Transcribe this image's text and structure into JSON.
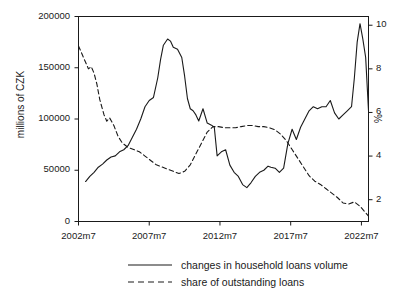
{
  "chart_data": {
    "type": "line",
    "title": "",
    "subtitle": "",
    "xlabel": "",
    "ylabel": "millions of CZK",
    "ylabel_right": "%",
    "grid": false,
    "legend_position": "bottom",
    "xlim": [
      2002.5,
      2023.0
    ],
    "ylim": [
      0,
      200000
    ],
    "ylim_right": [
      1.0,
      10.4
    ],
    "xticks": [
      "2002m7",
      "2007m7",
      "2012m7",
      "2017m7",
      "2022m7"
    ],
    "xtick_values": [
      2002.5,
      2007.5,
      2012.5,
      2017.5,
      2022.5
    ],
    "yticks_left": [
      "0",
      "50000",
      "100000",
      "150000",
      "200000"
    ],
    "ytick_values_left": [
      0,
      50000,
      100000,
      150000,
      200000
    ],
    "yticks_right": [
      "2",
      "4",
      "6",
      "8",
      "10"
    ],
    "ytick_values_right": [
      2,
      4,
      6,
      8,
      10
    ],
    "series": [
      {
        "name": "changes in household loans volume",
        "axis": "left",
        "style": "solid",
        "color": "#1a1a1a",
        "x": [
          2003.0,
          2003.3,
          2003.6,
          2003.9,
          2004.2,
          2004.5,
          2004.8,
          2005.1,
          2005.4,
          2005.7,
          2006.0,
          2006.3,
          2006.6,
          2006.9,
          2007.2,
          2007.5,
          2007.8,
          2008.1,
          2008.3,
          2008.5,
          2008.8,
          2009.0,
          2009.2,
          2009.5,
          2009.8,
          2010.0,
          2010.2,
          2010.4,
          2010.6,
          2010.8,
          2011.0,
          2011.3,
          2011.6,
          2011.9,
          2012.1,
          2012.3,
          2012.6,
          2012.9,
          2013.2,
          2013.5,
          2013.8,
          2014.1,
          2014.4,
          2014.7,
          2015.0,
          2015.3,
          2015.6,
          2015.9,
          2016.1,
          2016.4,
          2016.7,
          2017.0,
          2017.3,
          2017.6,
          2017.9,
          2018.2,
          2018.5,
          2018.8,
          2019.1,
          2019.4,
          2019.7,
          2020.0,
          2020.3,
          2020.6,
          2020.9,
          2021.2,
          2021.5,
          2021.8,
          2022.0,
          2022.2,
          2022.4,
          2022.6,
          2022.8,
          2023.0
        ],
        "y": [
          39000,
          44000,
          48000,
          53000,
          56000,
          60000,
          63000,
          64000,
          68000,
          70000,
          74000,
          82000,
          90000,
          100000,
          112000,
          118000,
          121000,
          140000,
          158000,
          172000,
          178000,
          176000,
          170000,
          168000,
          160000,
          142000,
          120000,
          110000,
          108000,
          104000,
          98000,
          110000,
          96000,
          94000,
          92000,
          64000,
          68000,
          70000,
          55000,
          48000,
          44000,
          36000,
          33000,
          38000,
          44000,
          48000,
          50000,
          54000,
          53000,
          52000,
          48000,
          52000,
          76000,
          90000,
          80000,
          92000,
          100000,
          108000,
          112000,
          110000,
          112000,
          112000,
          118000,
          106000,
          100000,
          104000,
          108000,
          112000,
          140000,
          175000,
          193000,
          178000,
          160000,
          108000
        ]
      },
      {
        "name": "share of outstanding loans",
        "axis": "right",
        "style": "dashed",
        "color": "#1a1a1a",
        "x": [
          2002.5,
          2002.8,
          2003.0,
          2003.2,
          2003.4,
          2003.6,
          2003.8,
          2004.0,
          2004.3,
          2004.5,
          2004.7,
          2005.0,
          2005.3,
          2005.6,
          2006.0,
          2006.4,
          2006.8,
          2007.2,
          2007.6,
          2008.0,
          2008.4,
          2008.8,
          2009.2,
          2009.6,
          2010.0,
          2010.4,
          2010.8,
          2011.2,
          2011.6,
          2012.0,
          2012.4,
          2012.8,
          2013.2,
          2013.6,
          2014.0,
          2014.4,
          2014.8,
          2015.2,
          2015.6,
          2016.0,
          2016.4,
          2016.8,
          2017.2,
          2017.6,
          2018.0,
          2018.4,
          2018.8,
          2019.2,
          2019.6,
          2020.0,
          2020.4,
          2020.8,
          2021.2,
          2021.6,
          2022.0,
          2022.4,
          2022.8,
          2023.0
        ],
        "y": [
          9.05,
          8.6,
          8.3,
          8.0,
          8.1,
          7.8,
          7.3,
          6.6,
          5.9,
          5.6,
          5.75,
          5.4,
          4.9,
          4.6,
          4.4,
          4.3,
          4.2,
          4.0,
          3.8,
          3.6,
          3.5,
          3.4,
          3.3,
          3.2,
          3.3,
          3.6,
          4.1,
          4.6,
          5.1,
          5.35,
          5.35,
          5.3,
          5.3,
          5.3,
          5.35,
          5.4,
          5.4,
          5.35,
          5.35,
          5.3,
          5.2,
          5.0,
          4.7,
          4.3,
          3.9,
          3.5,
          3.1,
          2.85,
          2.7,
          2.5,
          2.3,
          2.1,
          1.85,
          1.8,
          1.9,
          1.7,
          1.4,
          1.25
        ]
      }
    ]
  },
  "legend": {
    "items": [
      {
        "label": "changes in household loans volume",
        "style": "solid"
      },
      {
        "label": "share of outstanding loans",
        "style": "dashed"
      }
    ]
  }
}
